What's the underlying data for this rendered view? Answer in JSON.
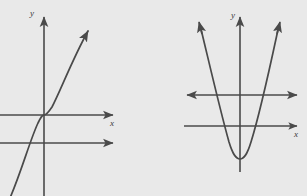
{
  "figure": {
    "background_color": "#e9e9e9",
    "stroke_color": "#4a4a4a",
    "panels": [
      {
        "id": "left-panel",
        "name": "cubic-graph",
        "curve_type": "cubic",
        "description": "Increasing cubic curve with inflection point at the origin, rising steeply to the upper right and falling off the lower left edge",
        "axes": {
          "y_axis": {
            "label": "y",
            "arrow": "up",
            "x_position": 44,
            "top": 14,
            "bottom": 196
          },
          "x_axis": {
            "label": "x",
            "arrow": "right",
            "y_position": 115,
            "left": 0,
            "right": 117
          }
        },
        "extra_lines": [
          {
            "name": "secondary-horizontal-line",
            "y_position": 143,
            "arrow": "right",
            "left": 0,
            "right": 117
          }
        ],
        "curve": {
          "inflection_point": [
            44,
            115
          ],
          "arrow_tip": [
            92,
            26
          ],
          "exit_point": [
            10,
            196
          ]
        }
      },
      {
        "id": "right-panel",
        "name": "parabola-graph",
        "curve_type": "parabola",
        "description": "Upward-opening parabola with vertex below the x-axis, both arms ending in arrowheads at the top",
        "axes": {
          "y_axis": {
            "label": "y",
            "arrow": "up",
            "x_position": 240,
            "top": 14,
            "bottom": 172
          },
          "x_axis": {
            "label": "x",
            "arrow": "right",
            "y_position": 126,
            "left": 184,
            "right": 301
          }
        },
        "extra_lines": [
          {
            "name": "secondary-horizontal-line",
            "y_position": 95,
            "arrow": "both",
            "left": 183,
            "right": 301
          }
        ],
        "curve": {
          "vertex": [
            240,
            158
          ],
          "left_arm_tip": [
            198,
            20
          ],
          "right_arm_tip": [
            281,
            20
          ]
        }
      }
    ],
    "labels": {
      "y": "y",
      "x": "x"
    }
  }
}
